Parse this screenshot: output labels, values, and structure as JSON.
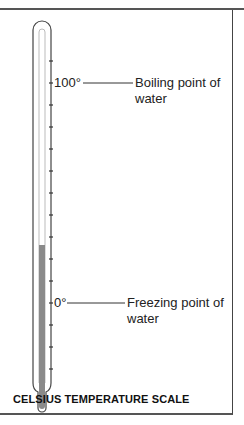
{
  "diagram": {
    "title": "CELSIUS TEMPERATURE SCALE",
    "thermometer": {
      "scale": "Celsius",
      "mercury_color": "#8a8a8a",
      "tick_count": 15,
      "marks": [
        {
          "value": "100°",
          "annotation": "Boiling point of water",
          "annotation_line1": "Boiling point of",
          "annotation_line2": "water"
        },
        {
          "value": "0°",
          "annotation": "Freezing point of water",
          "annotation_line1": "Freezing point of",
          "annotation_line2": "water"
        }
      ]
    }
  }
}
